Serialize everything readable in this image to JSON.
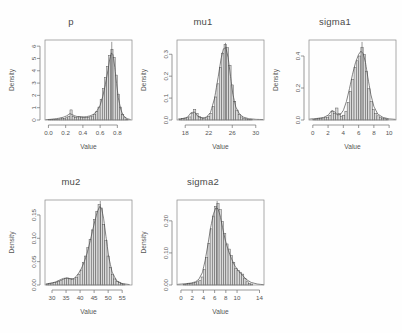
{
  "figure": {
    "kind": "r-multi-panel-histogram-density",
    "background": "#ffffff",
    "foreground": "#4a4a4a",
    "bar_fill": "#d9d9d9",
    "bar_stroke": "#4d4d4d",
    "curve_stroke": "#4a4a4a",
    "rows": 2,
    "cols": 3
  },
  "chart_data": [
    {
      "type": "bar",
      "id": "p",
      "title": "p",
      "xlabel": "Value",
      "ylabel": "Density",
      "xlim": [
        -0.04,
        0.97
      ],
      "ylim": [
        0,
        6.5
      ],
      "xticks": [
        0.0,
        0.2,
        0.4,
        0.6,
        0.8
      ],
      "xtick_labels": [
        "0.0",
        "0.2",
        "0.4",
        "0.6",
        "0.8"
      ],
      "yticks": [
        0,
        1,
        2,
        3,
        4,
        5,
        6
      ],
      "ytick_labels": [
        "0",
        "1",
        "2",
        "3",
        "4",
        "5",
        "6"
      ],
      "grid": false,
      "legend": "none",
      "bin_width": 0.025,
      "bin_starts": [
        0.0,
        0.025,
        0.05,
        0.075,
        0.1,
        0.125,
        0.15,
        0.175,
        0.2,
        0.225,
        0.25,
        0.275,
        0.3,
        0.325,
        0.35,
        0.375,
        0.4,
        0.425,
        0.45,
        0.475,
        0.5,
        0.525,
        0.55,
        0.575,
        0.6,
        0.625,
        0.65,
        0.675,
        0.7,
        0.725,
        0.75,
        0.775,
        0.8,
        0.825,
        0.85,
        0.875,
        0.9
      ],
      "values": [
        0.02,
        0.03,
        0.04,
        0.05,
        0.07,
        0.09,
        0.11,
        0.13,
        0.18,
        0.3,
        0.82,
        0.3,
        0.22,
        0.24,
        0.26,
        0.24,
        0.22,
        0.2,
        0.22,
        0.26,
        0.32,
        0.45,
        0.7,
        1.05,
        1.65,
        2.55,
        3.45,
        4.35,
        5.25,
        5.75,
        5.1,
        3.65,
        2.1,
        1.05,
        0.45,
        0.18,
        0.06
      ],
      "density_curve": {
        "x": [
          -0.03,
          0.02,
          0.07,
          0.12,
          0.17,
          0.21,
          0.25,
          0.28,
          0.32,
          0.36,
          0.4,
          0.44,
          0.48,
          0.52,
          0.56,
          0.6,
          0.63,
          0.66,
          0.69,
          0.71,
          0.73,
          0.75,
          0.77,
          0.79,
          0.81,
          0.84,
          0.87,
          0.91,
          0.95
        ],
        "y": [
          0.03,
          0.05,
          0.09,
          0.14,
          0.22,
          0.33,
          0.52,
          0.42,
          0.3,
          0.26,
          0.25,
          0.27,
          0.33,
          0.45,
          0.7,
          1.2,
          1.9,
          2.85,
          4.0,
          4.9,
          5.45,
          5.3,
          4.3,
          3.0,
          1.85,
          0.85,
          0.35,
          0.12,
          0.04
        ]
      },
      "peak_line": {
        "x": 0.735,
        "y": 6.35
      }
    },
    {
      "type": "bar",
      "id": "mu1",
      "title": "mu1",
      "xlabel": "Value",
      "ylabel": "Density",
      "xlim": [
        16.6,
        31.4
      ],
      "ylim": [
        0,
        0.365
      ],
      "xticks": [
        18,
        22,
        26,
        30
      ],
      "xtick_labels": [
        "18",
        "22",
        "26",
        "30"
      ],
      "yticks": [
        0.0,
        0.1,
        0.2,
        0.3
      ],
      "ytick_labels": [
        "0.0",
        "0.1",
        "0.2",
        "0.3"
      ],
      "grid": false,
      "legend": "none",
      "bin_width": 0.4,
      "bin_starts": [
        17.0,
        17.4,
        17.8,
        18.2,
        18.6,
        19.0,
        19.4,
        19.8,
        20.2,
        20.6,
        21.0,
        21.4,
        21.8,
        22.2,
        22.6,
        23.0,
        23.4,
        23.8,
        24.2,
        24.6,
        25.0,
        25.4,
        25.8,
        26.2,
        26.6,
        27.0,
        27.4,
        27.8,
        28.2,
        28.6,
        29.0
      ],
      "values": [
        0.004,
        0.006,
        0.008,
        0.01,
        0.014,
        0.03,
        0.048,
        0.03,
        0.016,
        0.01,
        0.008,
        0.01,
        0.016,
        0.03,
        0.062,
        0.105,
        0.165,
        0.24,
        0.305,
        0.345,
        0.33,
        0.25,
        0.16,
        0.085,
        0.045,
        0.024,
        0.014,
        0.008,
        0.005,
        0.003,
        0.002
      ],
      "density_curve": {
        "x": [
          16.8,
          17.6,
          18.4,
          19.0,
          19.6,
          20.2,
          20.9,
          21.6,
          22.3,
          23.0,
          23.6,
          24.1,
          24.5,
          24.9,
          25.3,
          25.7,
          26.1,
          26.6,
          27.2,
          27.9,
          28.8,
          30.0,
          31.2
        ],
        "y": [
          0.004,
          0.007,
          0.013,
          0.034,
          0.036,
          0.015,
          0.009,
          0.013,
          0.034,
          0.1,
          0.195,
          0.28,
          0.325,
          0.33,
          0.285,
          0.2,
          0.118,
          0.06,
          0.028,
          0.013,
          0.006,
          0.003,
          0.002
        ]
      },
      "peak_line": {
        "x": 24.85,
        "y": 0.352
      }
    },
    {
      "type": "bar",
      "id": "sigma1",
      "title": "sigma1",
      "xlabel": "Value",
      "ylabel": "Density",
      "xlim": [
        -0.5,
        10.9
      ],
      "ylim": [
        0,
        0.5
      ],
      "xticks": [
        0,
        2,
        4,
        6,
        8,
        10
      ],
      "xtick_labels": [
        "0",
        "2",
        "4",
        "6",
        "8",
        "10"
      ],
      "yticks": [
        0.0,
        0.2,
        0.4
      ],
      "ytick_labels": [
        "0.0",
        "0.2",
        "0.4"
      ],
      "grid": false,
      "legend": "none",
      "bin_width": 0.3,
      "bin_starts": [
        0.0,
        0.3,
        0.6,
        0.9,
        1.2,
        1.5,
        1.8,
        2.1,
        2.4,
        2.7,
        3.0,
        3.3,
        3.6,
        3.9,
        4.2,
        4.5,
        4.8,
        5.1,
        5.4,
        5.7,
        6.0,
        6.3,
        6.6,
        6.9,
        7.2,
        7.5,
        7.8,
        8.1,
        8.4,
        8.7,
        9.0,
        9.3,
        9.6
      ],
      "values": [
        0.004,
        0.006,
        0.008,
        0.01,
        0.012,
        0.014,
        0.018,
        0.028,
        0.055,
        0.042,
        0.075,
        0.04,
        0.024,
        0.03,
        0.055,
        0.11,
        0.18,
        0.255,
        0.33,
        0.37,
        0.4,
        0.455,
        0.41,
        0.305,
        0.195,
        0.115,
        0.065,
        0.04,
        0.026,
        0.018,
        0.012,
        0.008,
        0.005
      ],
      "density_curve": {
        "x": [
          -0.4,
          0.6,
          1.4,
          2.0,
          2.5,
          2.9,
          3.2,
          3.6,
          4.0,
          4.4,
          4.8,
          5.2,
          5.6,
          6.0,
          6.3,
          6.6,
          6.9,
          7.2,
          7.6,
          8.0,
          8.5,
          9.2,
          10.0,
          10.8
        ],
        "y": [
          0.006,
          0.01,
          0.016,
          0.03,
          0.06,
          0.05,
          0.032,
          0.034,
          0.06,
          0.115,
          0.195,
          0.285,
          0.36,
          0.41,
          0.43,
          0.415,
          0.36,
          0.27,
          0.16,
          0.085,
          0.038,
          0.016,
          0.007,
          0.004
        ]
      },
      "peak_line": {
        "x": 6.45,
        "y": 0.488
      }
    },
    {
      "type": "bar",
      "id": "mu2",
      "title": "mu2",
      "xlabel": "Value",
      "ylabel": "Density",
      "xlim": [
        27.5,
        58.5
      ],
      "ylim": [
        0,
        0.182
      ],
      "xticks": [
        30,
        35,
        40,
        45,
        50,
        55
      ],
      "xtick_labels": [
        "30",
        "35",
        "40",
        "45",
        "50",
        "55"
      ],
      "yticks": [
        0.0,
        0.05,
        0.1,
        0.15
      ],
      "ytick_labels": [
        "0.00",
        "0.05",
        "0.10",
        "0.15"
      ],
      "grid": false,
      "legend": "none",
      "bin_width": 0.8,
      "bin_starts": [
        28.0,
        28.8,
        29.6,
        30.4,
        31.2,
        32.0,
        32.8,
        33.6,
        34.4,
        35.2,
        36.0,
        36.8,
        37.6,
        38.4,
        39.2,
        40.0,
        40.8,
        41.6,
        42.4,
        43.2,
        44.0,
        44.8,
        45.6,
        46.4,
        47.2,
        48.0,
        48.8,
        49.6,
        50.4,
        51.2,
        52.0,
        52.8,
        53.6,
        54.4,
        55.2
      ],
      "values": [
        0.002,
        0.003,
        0.004,
        0.005,
        0.006,
        0.008,
        0.01,
        0.012,
        0.014,
        0.015,
        0.014,
        0.012,
        0.013,
        0.016,
        0.022,
        0.032,
        0.048,
        0.062,
        0.08,
        0.098,
        0.118,
        0.14,
        0.158,
        0.172,
        0.165,
        0.13,
        0.095,
        0.062,
        0.038,
        0.022,
        0.013,
        0.008,
        0.005,
        0.003,
        0.002
      ],
      "density_curve": {
        "x": [
          27.8,
          29.5,
          31.0,
          32.5,
          34.0,
          35.2,
          36.5,
          37.8,
          39.0,
          40.2,
          41.4,
          42.5,
          43.5,
          44.4,
          45.3,
          46.2,
          47.0,
          47.7,
          48.4,
          49.2,
          50.2,
          51.4,
          53.0,
          55.0,
          57.5
        ],
        "y": [
          0.002,
          0.004,
          0.006,
          0.01,
          0.014,
          0.015,
          0.013,
          0.014,
          0.021,
          0.032,
          0.048,
          0.068,
          0.092,
          0.115,
          0.138,
          0.158,
          0.168,
          0.163,
          0.142,
          0.105,
          0.06,
          0.028,
          0.009,
          0.003,
          0.001
        ]
      },
      "peak_line": {
        "x": 47.2,
        "y": 0.18
      }
    },
    {
      "type": "bar",
      "id": "sigma2",
      "title": "sigma2",
      "xlabel": "Value",
      "ylabel": "Density",
      "xlim": [
        -0.7,
        14.8
      ],
      "ylim": [
        0,
        0.265
      ],
      "xticks": [
        0,
        2,
        4,
        6,
        8,
        10,
        14
      ],
      "xtick_labels": [
        "0",
        "2",
        "4",
        "6",
        "8",
        "10",
        "14"
      ],
      "yticks": [
        0.0,
        0.1,
        0.2
      ],
      "ytick_labels": [
        "0.00",
        "0.10",
        "0.20"
      ],
      "grid": false,
      "legend": "none",
      "bin_width": 0.4,
      "bin_starts": [
        0.4,
        0.8,
        1.2,
        1.6,
        2.0,
        2.4,
        2.8,
        3.2,
        3.6,
        4.0,
        4.4,
        4.8,
        5.2,
        5.6,
        6.0,
        6.4,
        6.8,
        7.2,
        7.6,
        8.0,
        8.4,
        8.8,
        9.2,
        9.6,
        10.0,
        10.4,
        10.8,
        11.2,
        11.6,
        12.0,
        12.4
      ],
      "values": [
        0.002,
        0.003,
        0.004,
        0.005,
        0.006,
        0.008,
        0.01,
        0.014,
        0.025,
        0.048,
        0.085,
        0.13,
        0.175,
        0.215,
        0.245,
        0.255,
        0.235,
        0.198,
        0.16,
        0.128,
        0.112,
        0.092,
        0.07,
        0.052,
        0.045,
        0.04,
        0.034,
        0.02,
        0.01,
        0.005,
        0.003
      ],
      "density_curve": {
        "x": [
          -0.6,
          0.8,
          1.8,
          2.6,
          3.2,
          3.8,
          4.3,
          4.8,
          5.3,
          5.8,
          6.2,
          6.6,
          7.0,
          7.4,
          7.9,
          8.4,
          9.0,
          9.6,
          10.2,
          10.9,
          11.6,
          12.5,
          13.6,
          14.7
        ],
        "y": [
          0.002,
          0.004,
          0.006,
          0.01,
          0.018,
          0.038,
          0.075,
          0.125,
          0.18,
          0.222,
          0.24,
          0.238,
          0.215,
          0.18,
          0.14,
          0.11,
          0.082,
          0.06,
          0.045,
          0.032,
          0.018,
          0.008,
          0.003,
          0.001
        ]
      },
      "peak_line": {
        "x": 6.45,
        "y": 0.262
      }
    }
  ]
}
